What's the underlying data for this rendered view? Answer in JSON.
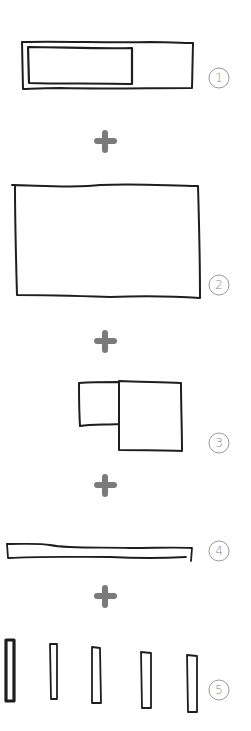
{
  "diagram": {
    "type": "hand-drawn sketch sequence",
    "colors": {
      "stroke": "#1e1e1e",
      "plus": "#7a7a7a",
      "label": "#8a8a8a",
      "background": "#ffffff"
    },
    "steps": [
      {
        "number": "1",
        "shape": "wide rectangle with inner rectangle on left"
      },
      {
        "number": "2",
        "shape": "large rectangle"
      },
      {
        "number": "3",
        "shape": "small square attached to larger square"
      },
      {
        "number": "4",
        "shape": "long thin horizontal bar"
      },
      {
        "number": "5",
        "shape": "five vertical bars"
      }
    ],
    "connectors": [
      {
        "symbol": "plus"
      },
      {
        "symbol": "plus"
      },
      {
        "symbol": "plus"
      },
      {
        "symbol": "plus"
      }
    ]
  }
}
